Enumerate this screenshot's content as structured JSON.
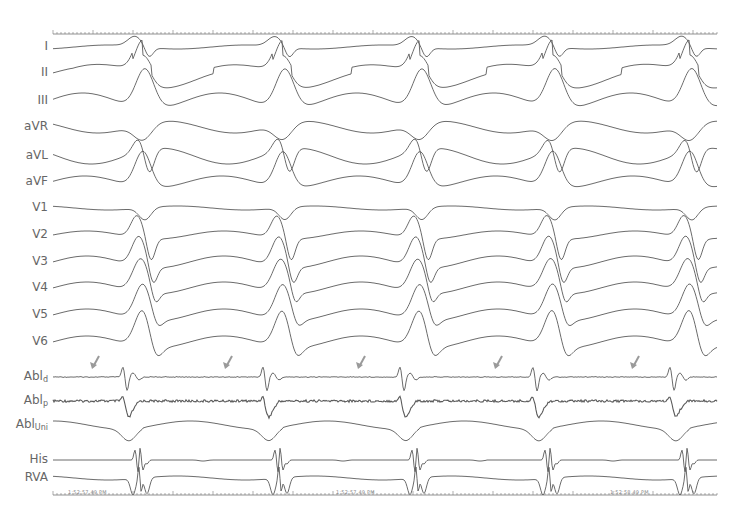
{
  "figure": {
    "type": "intracardiac electrogram with 12-lead surface ECG",
    "colors": {
      "trace": "#5a5a5a",
      "arrow": "#9a9a9a",
      "label": "#666666",
      "ruler": "#777777"
    }
  },
  "leads": [
    {
      "id": "I",
      "label": "I",
      "sub": "",
      "y": 47,
      "kind": "ecg"
    },
    {
      "id": "II",
      "label": "II",
      "sub": "",
      "y": 73,
      "kind": "ecg"
    },
    {
      "id": "III",
      "label": "III",
      "sub": "",
      "y": 101,
      "kind": "ecg"
    },
    {
      "id": "aVR",
      "label": "aVR",
      "sub": "",
      "y": 127,
      "kind": "ecg"
    },
    {
      "id": "aVL",
      "label": "aVL",
      "sub": "",
      "y": 156,
      "kind": "ecg"
    },
    {
      "id": "aVF",
      "label": "aVF",
      "sub": "",
      "y": 182,
      "kind": "ecg"
    },
    {
      "id": "V1",
      "label": "V1",
      "sub": "",
      "y": 208,
      "kind": "ecg"
    },
    {
      "id": "V2",
      "label": "V2",
      "sub": "",
      "y": 235,
      "kind": "ecg"
    },
    {
      "id": "V3",
      "label": "V3",
      "sub": "",
      "y": 262,
      "kind": "ecg"
    },
    {
      "id": "V4",
      "label": "V4",
      "sub": "",
      "y": 288,
      "kind": "ecg"
    },
    {
      "id": "V5",
      "label": "V5",
      "sub": "",
      "y": 315,
      "kind": "ecg"
    },
    {
      "id": "V6",
      "label": "V6",
      "sub": "",
      "y": 342,
      "kind": "ecg"
    },
    {
      "id": "Abl_d",
      "label": "Abl",
      "sub": "d",
      "y": 377,
      "kind": "bipolar"
    },
    {
      "id": "Abl_p",
      "label": "Abl",
      "sub": "p",
      "y": 401,
      "kind": "bipolar-noisy"
    },
    {
      "id": "Abl_Uni",
      "label": "Abl",
      "sub": "Uni",
      "y": 425,
      "kind": "unipolar"
    },
    {
      "id": "His",
      "label": "His",
      "sub": "",
      "y": 460,
      "kind": "his"
    },
    {
      "id": "RVA",
      "label": "RVA",
      "sub": "",
      "y": 478,
      "kind": "rva"
    }
  ],
  "beats_x": [
    143,
    283,
    420,
    553,
    690
  ],
  "arrows_x": [
    92,
    225,
    358,
    495,
    632
  ],
  "timestamps": [
    {
      "x": 68,
      "text": "1:52:57.49 PM"
    },
    {
      "x": 336,
      "text": "1:52:57.49 PM"
    },
    {
      "x": 610,
      "text": "1:52:58.49 PM"
    }
  ],
  "top_ruler": {
    "y": 34,
    "x_start": 53,
    "x_end": 717,
    "mark_text": "100 ms"
  },
  "bottom_ruler": {
    "y": 495,
    "x_start": 53,
    "x_end": 717
  }
}
